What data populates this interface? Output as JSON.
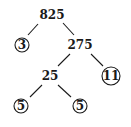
{
  "diagram": {
    "type": "factor-tree",
    "nodes": [
      {
        "id": "n825",
        "label": "825",
        "x": 52,
        "y": 15,
        "circled": false
      },
      {
        "id": "n3",
        "label": "3",
        "x": 22,
        "y": 45,
        "circled": true,
        "r": 7
      },
      {
        "id": "n275",
        "label": "275",
        "x": 80,
        "y": 45,
        "circled": false
      },
      {
        "id": "n25",
        "label": "25",
        "x": 50,
        "y": 76,
        "circled": false
      },
      {
        "id": "n11",
        "label": "11",
        "x": 111,
        "y": 76,
        "circled": true,
        "r": 9
      },
      {
        "id": "n5a",
        "label": "5",
        "x": 21,
        "y": 106,
        "circled": true,
        "r": 7
      },
      {
        "id": "n5b",
        "label": "5",
        "x": 80,
        "y": 106,
        "circled": true,
        "r": 7
      }
    ],
    "edges": [
      {
        "from": "n825",
        "to": "n3",
        "x1": 38,
        "y1": 24,
        "x2": 28,
        "y2": 35
      },
      {
        "from": "n825",
        "to": "n275",
        "x1": 63,
        "y1": 23,
        "x2": 74,
        "y2": 35
      },
      {
        "from": "n275",
        "to": "n25",
        "x1": 70,
        "y1": 54,
        "x2": 58,
        "y2": 66
      },
      {
        "from": "n275",
        "to": "n11",
        "x1": 91,
        "y1": 54,
        "x2": 103,
        "y2": 66
      },
      {
        "from": "n25",
        "to": "n5a",
        "x1": 42,
        "y1": 85,
        "x2": 30,
        "y2": 97
      },
      {
        "from": "n25",
        "to": "n5b",
        "x1": 58,
        "y1": 85,
        "x2": 71,
        "y2": 97
      }
    ]
  }
}
